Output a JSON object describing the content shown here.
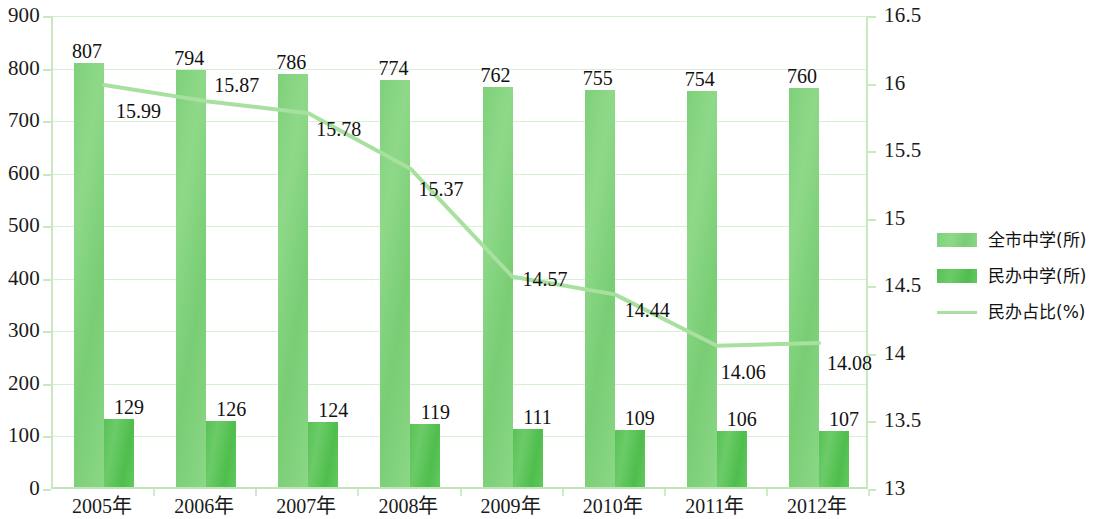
{
  "chart_data": {
    "type": "bar",
    "title": "",
    "subtitle": "",
    "xlabel": "",
    "ylabel": "",
    "grid": true,
    "legend_position": "right",
    "categories": [
      "2005年",
      "2006年",
      "2007年",
      "2008年",
      "2009年",
      "2010年",
      "2011年",
      "2012年"
    ],
    "axes": {
      "left": {
        "ylim": [
          0,
          900
        ],
        "tick_step": 100,
        "ticks": [
          "0",
          "100",
          "200",
          "300",
          "400",
          "500",
          "600",
          "700",
          "800",
          "900"
        ]
      },
      "right": {
        "ylim": [
          13,
          16.5
        ],
        "tick_step": 0.5,
        "ticks": [
          "13",
          "13.5",
          "14",
          "14.5",
          "15",
          "15.5",
          "16",
          "16.5"
        ]
      }
    },
    "series": [
      {
        "name": "全市中学(所)",
        "type": "bar",
        "axis": "left",
        "color": "#8ad785",
        "values": [
          807,
          794,
          786,
          774,
          762,
          755,
          754,
          760
        ]
      },
      {
        "name": "民办中学(所)",
        "type": "bar",
        "axis": "left",
        "color": "#56c254",
        "values": [
          129,
          126,
          124,
          119,
          111,
          109,
          106,
          107
        ]
      },
      {
        "name": "民办占比(%)",
        "type": "line",
        "axis": "right",
        "color": "#a8e09f",
        "values": [
          15.99,
          15.87,
          15.78,
          15.37,
          14.57,
          14.44,
          14.06,
          14.08
        ]
      }
    ]
  },
  "legend": {
    "items": [
      {
        "label": "全市中学(所)",
        "swatch": "bar-light-green"
      },
      {
        "label": "民办中学(所)",
        "swatch": "bar-dark-green"
      },
      {
        "label": "民办占比(%)",
        "swatch": "line-green"
      }
    ]
  }
}
